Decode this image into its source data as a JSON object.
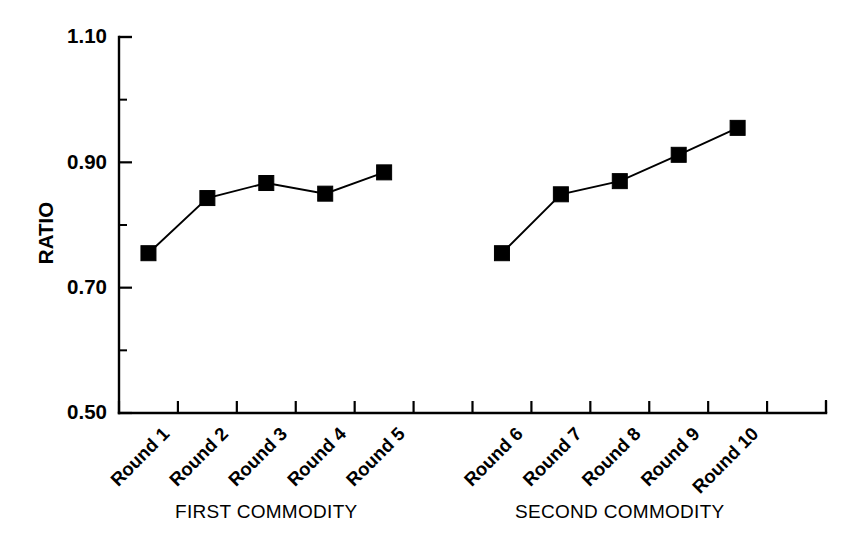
{
  "chart_data": {
    "type": "line",
    "title": "",
    "subtitle": "",
    "xlabel": "",
    "ylabel": "RATIO",
    "ylim": [
      0.5,
      1.1
    ],
    "yticks": [
      0.5,
      0.7,
      0.9,
      1.1
    ],
    "ytick_labels": [
      "0.50",
      "0.70",
      "0.90",
      "1.10"
    ],
    "y_minor_ticks": [
      0.6,
      0.8,
      1.0
    ],
    "grid": false,
    "legend": "none",
    "marker": "filled-square",
    "line_color": "#000000",
    "marker_color": "#000000",
    "categories": [
      "Round 1",
      "Round 2",
      "Round 3",
      "Round 4",
      "Round 5",
      "Round 6",
      "Round 7",
      "Round 8",
      "Round 9",
      "Round 10"
    ],
    "x_positions": [
      1,
      2,
      3,
      4,
      5,
      7,
      8,
      9,
      10,
      11
    ],
    "xlim": [
      0.5,
      12.5
    ],
    "series": [
      {
        "name": "FIRST COMMODITY",
        "categories": [
          "Round 1",
          "Round 2",
          "Round 3",
          "Round 4",
          "Round 5"
        ],
        "x": [
          1,
          2,
          3,
          4,
          5
        ],
        "values": [
          0.755,
          0.843,
          0.867,
          0.85,
          0.884
        ]
      },
      {
        "name": "SECOND COMMODITY",
        "categories": [
          "Round 6",
          "Round 7",
          "Round 8",
          "Round 9",
          "Round 10"
        ],
        "x": [
          7,
          8,
          9,
          10,
          11
        ],
        "values": [
          0.755,
          0.849,
          0.87,
          0.912,
          0.955
        ]
      }
    ],
    "group_labels": [
      {
        "text": "FIRST COMMODITY",
        "center_x": 3
      },
      {
        "text": "SECOND COMMODITY",
        "center_x": 9
      }
    ]
  }
}
